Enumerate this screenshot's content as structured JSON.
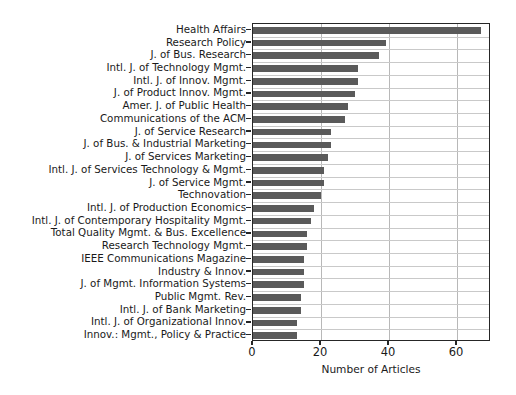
{
  "chart_data": {
    "type": "bar",
    "orientation": "horizontal",
    "title": "",
    "xlabel": "Number of  Articles",
    "ylabel": "",
    "xlim": [
      0,
      70
    ],
    "ylim": [
      0,
      24
    ],
    "xticks": [
      0,
      20,
      40,
      60
    ],
    "xticklabels": [
      "0",
      "20",
      "40",
      "60"
    ],
    "grid": "vertical-and-horizontal",
    "legend": "none",
    "bar_color": "#5a5a5a",
    "categories": [
      "Health Affairs",
      "Research Policy",
      "J. of Bus. Research",
      "Intl. J. of Technology Mgmt.",
      "Intl. J. of Innov. Mgmt.",
      "J. of Product Innov. Mgmt.",
      "Amer. J. of Public Health",
      "Communications of the ACM",
      "J. of Service Research",
      "J. of Bus. & Industrial Marketing",
      "J. of Services Marketing",
      "Intl. J. of Services Technology & Mgmt.",
      "J. of Service Mgmt.",
      "Technovation",
      "Intl. J. of Production Economics",
      "Intl. J. of Contemporary Hospitality Mgmt.",
      "Total Quality Mgmt. & Bus. Excellence",
      "Research Technology Mgmt.",
      "IEEE Communications Magazine",
      "Industry & Innov.",
      "J. of Mgmt. Information Systems",
      "Public Mgmt. Rev.",
      "Intl. J. of Bank Marketing",
      "Intl. J. of Organizational Innov.",
      "Innov.: Mgmt., Policy & Practice"
    ],
    "values": [
      67,
      39,
      37,
      31,
      31,
      30,
      28,
      27,
      23,
      23,
      22,
      21,
      21,
      20,
      18,
      17,
      16,
      16,
      15,
      15,
      15,
      14,
      14,
      13,
      13
    ]
  }
}
